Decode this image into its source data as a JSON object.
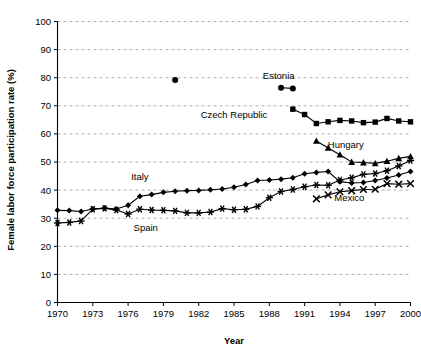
{
  "chart_data": {
    "type": "line",
    "title": "",
    "xlabel": "Year",
    "ylabel": "Female labor force participation rate (%)",
    "xlim": [
      1970,
      2000
    ],
    "ylim": [
      0,
      100
    ],
    "ytick_step": 10,
    "xtick_step": 3,
    "xticks": [
      1970,
      1973,
      1976,
      1979,
      1982,
      1985,
      1988,
      1991,
      1994,
      1997,
      2000
    ],
    "yticks": [
      0,
      10,
      20,
      30,
      40,
      50,
      60,
      70,
      80,
      90,
      100
    ],
    "grid": "horizontal-dashed",
    "legend": "inline-annotations",
    "series": [
      {
        "name": "Italy",
        "marker": "diamond",
        "label_x": 1977.0,
        "label_y": 43.5,
        "x": [
          1970,
          1971,
          1972,
          1973,
          1974,
          1975,
          1976,
          1977,
          1978,
          1979,
          1980,
          1981,
          1982,
          1983,
          1984,
          1985,
          1986,
          1987,
          1988,
          1989,
          1990,
          1991,
          1992,
          1993,
          1994,
          1995,
          1996,
          1997,
          1998,
          1999,
          2000
        ],
        "values": [
          32.8,
          32.7,
          32.4,
          33.3,
          33.6,
          33.3,
          34.6,
          37.8,
          38.4,
          39.2,
          39.6,
          39.8,
          39.9,
          40.1,
          40.4,
          41.0,
          42.0,
          43.4,
          43.6,
          43.9,
          44.4,
          45.8,
          46.3,
          46.6,
          43.0,
          42.5,
          42.7,
          43.4,
          44.3,
          45.4,
          46.6
        ]
      },
      {
        "name": "Spain",
        "marker": "asterisk",
        "label_x": 1977.5,
        "label_y": 25.5,
        "x": [
          1970,
          1971,
          1972,
          1973,
          1974,
          1975,
          1976,
          1977,
          1978,
          1979,
          1980,
          1981,
          1982,
          1983,
          1984,
          1985,
          1986,
          1987,
          1988,
          1989,
          1990,
          1991,
          1992,
          1993,
          1994,
          1995,
          1996,
          1997,
          1998,
          1999,
          2000
        ],
        "values": [
          28.3,
          28.5,
          29.0,
          33.2,
          33.5,
          32.9,
          31.5,
          33.2,
          32.9,
          32.8,
          32.6,
          31.9,
          31.9,
          32.2,
          33.4,
          33.0,
          33.2,
          34.2,
          37.3,
          39.5,
          40.2,
          41.2,
          41.8,
          41.7,
          43.6,
          44.4,
          45.6,
          45.9,
          46.9,
          48.6,
          50.5
        ]
      },
      {
        "name": "Estonia",
        "marker": "circle",
        "label_x": 1988.8,
        "label_y": 79.5,
        "x": [
          1980,
          1989,
          1990
        ],
        "values": [
          79.2,
          76.4,
          76.2
        ]
      },
      {
        "name": "Czech Republic",
        "marker": "square",
        "label_x": 1985.0,
        "label_y": 65.5,
        "x": [
          1990,
          1991,
          1992,
          1993,
          1994,
          1995,
          1996,
          1997,
          1998,
          1999,
          2000
        ],
        "values": [
          68.8,
          66.9,
          63.7,
          64.3,
          64.8,
          64.6,
          64.0,
          64.2,
          65.5,
          64.6,
          64.3
        ]
      },
      {
        "name": "Hungary",
        "marker": "triangle",
        "label_x": 1994.5,
        "label_y": 55.0,
        "x": [
          1992,
          1993,
          1994,
          1995,
          1996,
          1997,
          1998,
          1999,
          2000
        ],
        "values": [
          57.5,
          55.0,
          52.6,
          50.0,
          49.8,
          49.5,
          50.3,
          51.3,
          52.0
        ]
      },
      {
        "name": "Mexico",
        "marker": "cross",
        "label_x": 1994.8,
        "label_y": 36.0,
        "x": [
          1992,
          1993,
          1994,
          1995,
          1996,
          1997,
          1998,
          1999,
          2000
        ],
        "values": [
          36.9,
          38.3,
          39.4,
          39.8,
          40.2,
          40.3,
          42.3,
          42.1,
          42.3
        ]
      }
    ]
  },
  "axes": {
    "x_title": "Year",
    "y_title": "Female labor force participation rate (%)"
  },
  "tick_text": {
    "y": [
      "100",
      "90",
      "80",
      "70",
      "60",
      "50",
      "40",
      "30",
      "20",
      "10",
      "0"
    ],
    "x": [
      "1970",
      "1973",
      "1976",
      "1979",
      "1982",
      "1985",
      "1988",
      "1991",
      "1994",
      "1997",
      "2000"
    ]
  },
  "labels": {
    "italy": "Italy",
    "spain": "Spain",
    "estonia": "Estonia",
    "czech": "Czech Republic",
    "hungary": "Hungary",
    "mexico": "Mexico"
  },
  "colors": {
    "foreground": "#000000",
    "background": "#ffffff",
    "grid": "#999999"
  }
}
